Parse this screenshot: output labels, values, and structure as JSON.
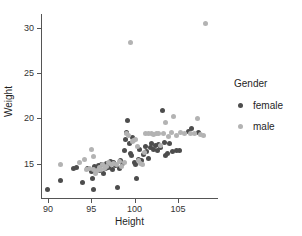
{
  "chart_data": {
    "type": "scatter",
    "title": "",
    "xlabel": "Height",
    "ylabel": "Weight",
    "xlim": [
      89.2,
      109.5
    ],
    "ylim": [
      11.2,
      31.5
    ],
    "xticks": [
      90,
      95,
      100,
      105
    ],
    "yticks": [
      15,
      20,
      25,
      30
    ],
    "grid": false,
    "legend": {
      "title": "Gender",
      "position": "right",
      "entries": [
        {
          "name": "female",
          "color": "#4d4d4d"
        },
        {
          "name": "male",
          "color": "#b3b3b3"
        }
      ]
    },
    "series": [
      {
        "name": "female",
        "color": "#4d4d4d",
        "points": [
          [
            90.0,
            12.1
          ],
          [
            91.4,
            13.1
          ],
          [
            92.9,
            14.5
          ],
          [
            93.3,
            14.6
          ],
          [
            94.0,
            12.9
          ],
          [
            94.6,
            14.5
          ],
          [
            95.0,
            14.1
          ],
          [
            95.1,
            13.3
          ],
          [
            95.2,
            12.1
          ],
          [
            95.4,
            14.7
          ],
          [
            95.6,
            14.3
          ],
          [
            95.8,
            14.8
          ],
          [
            96.0,
            14.2
          ],
          [
            96.2,
            14.9
          ],
          [
            96.4,
            13.9
          ],
          [
            96.6,
            14.4
          ],
          [
            96.8,
            15.0
          ],
          [
            97.0,
            14.6
          ],
          [
            97.2,
            15.2
          ],
          [
            97.4,
            14.3
          ],
          [
            97.6,
            15.1
          ],
          [
            97.8,
            14.8
          ],
          [
            98.0,
            12.4
          ],
          [
            98.2,
            14.4
          ],
          [
            98.4,
            15.3
          ],
          [
            98.6,
            15.0
          ],
          [
            98.8,
            16.4
          ],
          [
            99.0,
            17.6
          ],
          [
            99.1,
            18.4
          ],
          [
            99.2,
            19.8
          ],
          [
            99.4,
            17.2
          ],
          [
            99.5,
            16.1
          ],
          [
            99.6,
            15.9
          ],
          [
            99.8,
            17.9
          ],
          [
            100.0,
            15.1
          ],
          [
            100.1,
            14.9
          ],
          [
            100.2,
            13.3
          ],
          [
            100.4,
            15.4
          ],
          [
            100.6,
            16.6
          ],
          [
            100.8,
            15.3
          ],
          [
            101.0,
            16.0
          ],
          [
            101.2,
            16.9
          ],
          [
            101.4,
            16.3
          ],
          [
            101.6,
            15.6
          ],
          [
            101.8,
            16.8
          ],
          [
            102.0,
            17.2
          ],
          [
            102.2,
            16.6
          ],
          [
            102.4,
            17.0
          ],
          [
            102.6,
            16.4
          ],
          [
            102.8,
            17.1
          ],
          [
            103.0,
            16.8
          ],
          [
            103.2,
            20.9
          ],
          [
            103.4,
            17.3
          ],
          [
            103.6,
            15.9
          ],
          [
            103.8,
            16.1
          ],
          [
            104.0,
            17.2
          ],
          [
            104.4,
            16.3
          ],
          [
            104.8,
            16.4
          ],
          [
            105.2,
            16.4
          ],
          [
            106.2,
            18.5
          ],
          [
            106.6,
            18.9
          ],
          [
            107.4,
            18.4
          ]
        ]
      },
      {
        "name": "male",
        "color": "#b3b3b3",
        "points": [
          [
            91.5,
            14.9
          ],
          [
            93.6,
            15.1
          ],
          [
            94.2,
            15.4
          ],
          [
            94.5,
            14.3
          ],
          [
            94.8,
            14.5
          ],
          [
            95.0,
            16.6
          ],
          [
            95.2,
            15.8
          ],
          [
            95.3,
            14.3
          ],
          [
            95.5,
            13.9
          ],
          [
            95.7,
            14.2
          ],
          [
            95.9,
            14.6
          ],
          [
            96.1,
            14.3
          ],
          [
            96.3,
            14.9
          ],
          [
            96.5,
            14.5
          ],
          [
            96.7,
            14.7
          ],
          [
            97.0,
            15.1
          ],
          [
            97.3,
            14.9
          ],
          [
            97.6,
            15.0
          ],
          [
            97.9,
            14.9
          ],
          [
            98.2,
            15.2
          ],
          [
            98.5,
            14.7
          ],
          [
            98.8,
            15.1
          ],
          [
            99.1,
            18.3
          ],
          [
            99.3,
            18.1
          ],
          [
            99.5,
            28.4
          ],
          [
            99.7,
            17.4
          ],
          [
            99.9,
            17.5
          ],
          [
            100.1,
            17.6
          ],
          [
            100.3,
            16.9
          ],
          [
            100.5,
            15.3
          ],
          [
            100.7,
            15.0
          ],
          [
            100.9,
            14.9
          ],
          [
            101.1,
            16.2
          ],
          [
            101.3,
            18.3
          ],
          [
            101.6,
            18.3
          ],
          [
            101.9,
            18.3
          ],
          [
            102.2,
            18.2
          ],
          [
            102.5,
            18.3
          ],
          [
            102.8,
            18.3
          ],
          [
            103.0,
            17.0
          ],
          [
            103.3,
            18.3
          ],
          [
            103.6,
            19.5
          ],
          [
            103.9,
            18.0
          ],
          [
            104.2,
            18.4
          ],
          [
            104.5,
            20.2
          ],
          [
            104.8,
            18.1
          ],
          [
            105.3,
            18.4
          ],
          [
            105.8,
            18.3
          ],
          [
            106.4,
            18.3
          ],
          [
            106.9,
            18.3
          ],
          [
            107.2,
            20.0
          ],
          [
            107.6,
            18.2
          ],
          [
            107.9,
            18.1
          ],
          [
            108.2,
            30.5
          ]
        ]
      }
    ]
  },
  "axes": {
    "x_title": "Height",
    "y_title": "Weight",
    "x_tick_labels": [
      "90",
      "95",
      "100",
      "105"
    ],
    "y_tick_labels": [
      "15",
      "20",
      "25",
      "30"
    ]
  },
  "legend": {
    "title": "Gender",
    "items": [
      {
        "label": "female"
      },
      {
        "label": "male"
      }
    ]
  }
}
